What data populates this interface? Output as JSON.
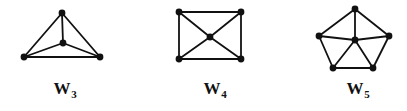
{
  "figure": {
    "caption_style": "bold-serif",
    "background_color": "#ffffff",
    "ink_color": "#111111",
    "width": 407,
    "height": 111
  },
  "chart_data": {
    "type": "diagram",
    "subtype": "graph-theory-wheel-graphs",
    "title": "",
    "xlabel": "",
    "ylabel": "",
    "grid": false,
    "legend": null,
    "edge_color": "#111111",
    "vertex_color": "#111111",
    "edge_width": 1.8,
    "vertex_radius": 3.4,
    "graphs": [
      {
        "id": "W3",
        "label_text": "W",
        "label_sub": "3",
        "label_x": 65,
        "label_y": 80,
        "n_vertices": 4,
        "n_rim": 3,
        "n_edges": 6,
        "hub": "C",
        "vertices": [
          {
            "id": "A",
            "role": "rim",
            "x": 62,
            "y": 13
          },
          {
            "id": "B",
            "role": "rim",
            "x": 24,
            "y": 57
          },
          {
            "id": "D",
            "role": "rim",
            "x": 100,
            "y": 57
          },
          {
            "id": "C",
            "role": "hub",
            "x": 63,
            "y": 43
          }
        ],
        "edges": [
          [
            "A",
            "B"
          ],
          [
            "B",
            "D"
          ],
          [
            "D",
            "A"
          ],
          [
            "C",
            "A"
          ],
          [
            "C",
            "B"
          ],
          [
            "C",
            "D"
          ]
        ]
      },
      {
        "id": "W4",
        "label_text": "W",
        "label_sub": "4",
        "label_x": 215,
        "label_y": 80,
        "n_vertices": 5,
        "n_rim": 4,
        "n_edges": 8,
        "hub": "E",
        "vertices": [
          {
            "id": "A",
            "role": "rim",
            "x": 179,
            "y": 12
          },
          {
            "id": "B",
            "role": "rim",
            "x": 241,
            "y": 12
          },
          {
            "id": "C",
            "role": "rim",
            "x": 241,
            "y": 59
          },
          {
            "id": "D",
            "role": "rim",
            "x": 179,
            "y": 59
          },
          {
            "id": "E",
            "role": "hub",
            "x": 210,
            "y": 37
          }
        ],
        "edges": [
          [
            "A",
            "B"
          ],
          [
            "B",
            "C"
          ],
          [
            "C",
            "D"
          ],
          [
            "D",
            "A"
          ],
          [
            "E",
            "A"
          ],
          [
            "E",
            "B"
          ],
          [
            "E",
            "C"
          ],
          [
            "E",
            "D"
          ]
        ]
      },
      {
        "id": "W5",
        "label_text": "W",
        "label_sub": "5",
        "label_x": 358,
        "label_y": 80,
        "n_vertices": 6,
        "n_rim": 5,
        "n_edges": 10,
        "hub": "F",
        "vertices": [
          {
            "id": "A",
            "role": "rim",
            "x": 355,
            "y": 9
          },
          {
            "id": "B",
            "role": "rim",
            "x": 389,
            "y": 36
          },
          {
            "id": "C",
            "role": "rim",
            "x": 373,
            "y": 68
          },
          {
            "id": "D",
            "role": "rim",
            "x": 333,
            "y": 68
          },
          {
            "id": "E",
            "role": "rim",
            "x": 319,
            "y": 36
          },
          {
            "id": "F",
            "role": "hub",
            "x": 355,
            "y": 40
          }
        ],
        "edges": [
          [
            "A",
            "B"
          ],
          [
            "B",
            "C"
          ],
          [
            "C",
            "D"
          ],
          [
            "D",
            "E"
          ],
          [
            "E",
            "A"
          ],
          [
            "F",
            "A"
          ],
          [
            "F",
            "B"
          ],
          [
            "F",
            "C"
          ],
          [
            "F",
            "D"
          ],
          [
            "F",
            "E"
          ]
        ]
      }
    ]
  }
}
